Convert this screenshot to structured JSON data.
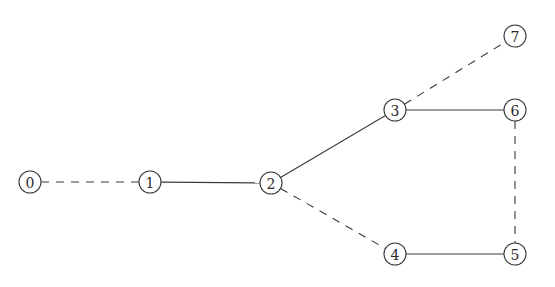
{
  "diagram": {
    "type": "graph",
    "node_radius": 11,
    "colors": {
      "stroke": "#3a3a3a",
      "label": "#2a2a2a",
      "background": "#ffffff"
    },
    "nodes": [
      {
        "id": "0",
        "label": "0",
        "x": 30,
        "y": 182
      },
      {
        "id": "1",
        "label": "1",
        "x": 150,
        "y": 182
      },
      {
        "id": "2",
        "label": "2",
        "x": 271,
        "y": 183
      },
      {
        "id": "3",
        "label": "3",
        "x": 395,
        "y": 110
      },
      {
        "id": "4",
        "label": "4",
        "x": 395,
        "y": 254
      },
      {
        "id": "5",
        "label": "5",
        "x": 515,
        "y": 254
      },
      {
        "id": "6",
        "label": "6",
        "x": 515,
        "y": 110
      },
      {
        "id": "7",
        "label": "7",
        "x": 515,
        "y": 36
      }
    ],
    "edges": [
      {
        "from": "0",
        "to": "1",
        "style": "dashed"
      },
      {
        "from": "1",
        "to": "2",
        "style": "solid"
      },
      {
        "from": "2",
        "to": "3",
        "style": "solid"
      },
      {
        "from": "2",
        "to": "4",
        "style": "dashed"
      },
      {
        "from": "3",
        "to": "6",
        "style": "solid"
      },
      {
        "from": "3",
        "to": "7",
        "style": "dashed"
      },
      {
        "from": "4",
        "to": "5",
        "style": "solid"
      },
      {
        "from": "6",
        "to": "5",
        "style": "dashed"
      }
    ]
  }
}
